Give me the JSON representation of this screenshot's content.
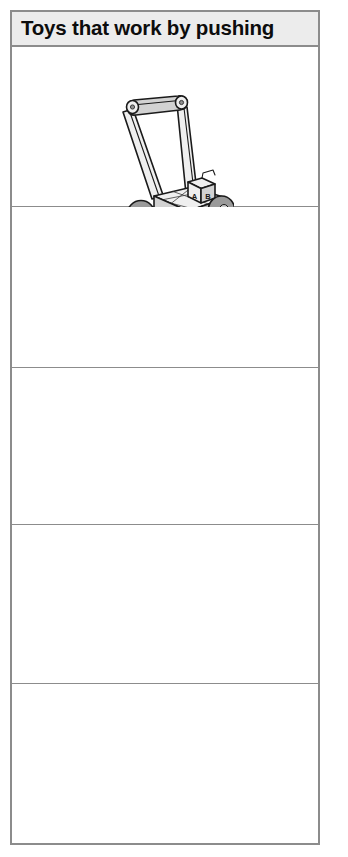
{
  "page": {
    "background_color": "#ffffff",
    "width": 348,
    "height": 857
  },
  "worksheet": {
    "border_color": "#8c8c8c",
    "header": {
      "title": "Toys that work by pushing",
      "background_color": "#ececec",
      "text_color": "#0d0d0d"
    },
    "rows": [
      {
        "index": 1,
        "filled": true,
        "illustration": {
          "name": "baby-push-walker-toy",
          "description": "Line drawing of a baby push-along walker with a tall U-shaped handle, four wheels and alphabet blocks on the cart",
          "block_letters": [
            "A",
            "B"
          ],
          "outline_color": "#1a1a1a",
          "body_fill": "#e8e8e8",
          "shade_fill": "#b8b8b8",
          "wheel_fill": "#9a9a9a",
          "wheel_hub_fill": "#e0e0e0"
        }
      },
      {
        "index": 2,
        "filled": false,
        "illustration": null
      },
      {
        "index": 3,
        "filled": false,
        "illustration": null
      },
      {
        "index": 4,
        "filled": false,
        "illustration": null
      },
      {
        "index": 5,
        "filled": false,
        "illustration": null
      }
    ]
  }
}
